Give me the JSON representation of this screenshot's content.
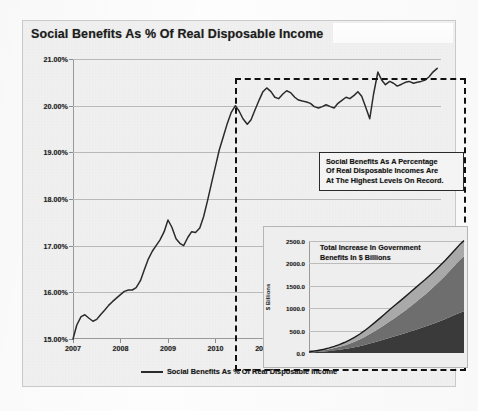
{
  "chart_data": {
    "type": "line",
    "title": "Social Benefits As % Of Real Disposable Income",
    "xlabel": "",
    "ylabel": "",
    "ylim": [
      15.0,
      21.0
    ],
    "xlim": [
      2007.0,
      2014.75
    ],
    "grid": true,
    "legend_position": "bottom-center",
    "y_ticks": [
      "15.00%",
      "16.00%",
      "17.00%",
      "18.00%",
      "19.00%",
      "20.00%",
      "21.00%"
    ],
    "y_tick_values": [
      15,
      16,
      17,
      18,
      19,
      20,
      21
    ],
    "x_ticks": [
      "2007",
      "2008",
      "2009",
      "2010",
      "2011",
      "2012",
      "2013",
      "2014"
    ],
    "x_tick_values": [
      2007,
      2008,
      2009,
      2010,
      2011,
      2012,
      2013,
      2014
    ],
    "series": [
      {
        "name": "Social Benefits As % Of Real Disposable Income",
        "color": "#2b2b2b",
        "x": [
          2007.0,
          2007.08,
          2007.17,
          2007.25,
          2007.33,
          2007.42,
          2007.5,
          2007.58,
          2007.67,
          2007.75,
          2007.83,
          2007.92,
          2008.0,
          2008.08,
          2008.17,
          2008.25,
          2008.33,
          2008.42,
          2008.5,
          2008.58,
          2008.67,
          2008.75,
          2008.83,
          2008.92,
          2009.0,
          2009.08,
          2009.17,
          2009.25,
          2009.33,
          2009.42,
          2009.5,
          2009.58,
          2009.67,
          2009.75,
          2009.83,
          2009.92,
          2010.0,
          2010.08,
          2010.17,
          2010.25,
          2010.33,
          2010.42,
          2010.5,
          2010.58,
          2010.67,
          2010.75,
          2010.83,
          2010.92,
          2011.0,
          2011.08,
          2011.17,
          2011.25,
          2011.33,
          2011.42,
          2011.5,
          2011.58,
          2011.67,
          2011.75,
          2011.83,
          2011.92,
          2012.0,
          2012.08,
          2012.17,
          2012.25,
          2012.33,
          2012.42,
          2012.5,
          2012.58,
          2012.67,
          2012.75,
          2012.83,
          2012.92,
          2013.0,
          2013.08,
          2013.17,
          2013.25,
          2013.33,
          2013.42,
          2013.5,
          2013.58,
          2013.67,
          2013.75,
          2013.83,
          2013.92,
          2014.0,
          2014.08,
          2014.17,
          2014.25,
          2014.33,
          2014.42,
          2014.5,
          2014.58,
          2014.67
        ],
        "values": [
          15.0,
          15.3,
          15.48,
          15.52,
          15.45,
          15.38,
          15.42,
          15.52,
          15.62,
          15.72,
          15.8,
          15.88,
          15.95,
          16.02,
          16.05,
          16.05,
          16.1,
          16.25,
          16.48,
          16.7,
          16.88,
          17.0,
          17.12,
          17.3,
          17.55,
          17.4,
          17.15,
          17.05,
          17.0,
          17.18,
          17.3,
          17.28,
          17.38,
          17.62,
          17.95,
          18.35,
          18.7,
          19.05,
          19.35,
          19.62,
          19.85,
          20.0,
          19.88,
          19.72,
          19.6,
          19.7,
          19.9,
          20.12,
          20.3,
          20.38,
          20.3,
          20.18,
          20.15,
          20.25,
          20.32,
          20.28,
          20.18,
          20.12,
          20.1,
          20.08,
          20.05,
          19.98,
          19.95,
          19.98,
          20.02,
          19.98,
          19.95,
          20.05,
          20.12,
          20.18,
          20.15,
          20.22,
          20.3,
          20.2,
          19.95,
          19.72,
          20.25,
          20.72,
          20.55,
          20.45,
          20.52,
          20.48,
          20.42,
          20.46,
          20.5,
          20.52,
          20.48,
          20.5,
          20.52,
          20.55,
          20.62,
          20.72,
          20.8
        ]
      }
    ],
    "annotations": [
      {
        "name": "highlight-callout",
        "lines": [
          "Social Benefits As  A Percentage",
          "Of Real Disposable Incomes Are",
          "At The Highest Levels On Record."
        ]
      },
      {
        "name": "highlight-region",
        "shape": "dashed-rectangle",
        "x_range": [
          2010.0,
          2014.75
        ]
      }
    ],
    "inset": {
      "type": "area",
      "title_lines": [
        "Total Increase In Government",
        "Benefits In $ Billions"
      ],
      "ylabel": "$ Billions",
      "ylim": [
        0,
        2500
      ],
      "y_ticks": [
        "0.0",
        "500.0",
        "1000.0",
        "1500.0",
        "2000.0",
        "2500.0"
      ],
      "y_tick_values": [
        0,
        500,
        1000,
        1500,
        2000,
        2500
      ],
      "stacked": true,
      "x": [
        2007.0,
        2007.25,
        2007.5,
        2007.75,
        2008.0,
        2008.25,
        2008.5,
        2008.75,
        2009.0,
        2009.25,
        2009.5,
        2009.75,
        2010.0,
        2010.25,
        2010.5,
        2010.75,
        2011.0,
        2011.25,
        2011.5,
        2011.75,
        2012.0,
        2012.25,
        2012.5,
        2012.75,
        2013.0,
        2013.25,
        2013.5,
        2013.75,
        2014.0,
        2014.25,
        2014.5,
        2014.67
      ],
      "series": [
        {
          "name": "layer-bottom",
          "color": "#3a3a3a",
          "values": [
            10,
            18,
            26,
            34,
            45,
            58,
            72,
            88,
            105,
            128,
            152,
            180,
            210,
            240,
            272,
            305,
            340,
            372,
            405,
            440,
            478,
            515,
            552,
            590,
            630,
            672,
            715,
            760,
            808,
            858,
            905,
            930
          ]
        },
        {
          "name": "layer-middle",
          "color": "#6e6e6e",
          "values": [
            8,
            14,
            22,
            30,
            40,
            52,
            66,
            82,
            100,
            122,
            148,
            178,
            212,
            248,
            286,
            326,
            368,
            412,
            458,
            505,
            555,
            608,
            662,
            718,
            778,
            840,
            905,
            972,
            1042,
            1115,
            1190,
            1230
          ]
        },
        {
          "name": "layer-top",
          "color": "#a9a9a9",
          "values": [
            5,
            9,
            14,
            20,
            28,
            38,
            50,
            64,
            80,
            98,
            118,
            140,
            165,
            190,
            215,
            240,
            262,
            280,
            295,
            308,
            318,
            325,
            330,
            332,
            334,
            336,
            338,
            340,
            342,
            344,
            346,
            348
          ]
        }
      ]
    }
  },
  "legend": {
    "label": "Social Benefits As % Of Real Disposable Income"
  }
}
